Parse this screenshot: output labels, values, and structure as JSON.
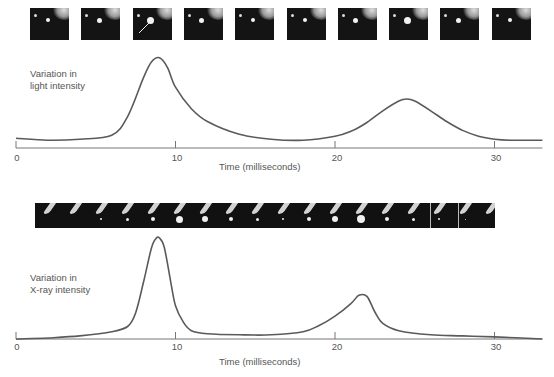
{
  "chart_data": [
    {
      "type": "line",
      "title": "",
      "ylabel": "Variation in light intensity",
      "xlabel": "Time (milliseconds)",
      "x_ticks": [
        0,
        10,
        20,
        30
      ],
      "xlim": [
        0,
        33
      ],
      "grid": false,
      "legend": null,
      "series": [
        {
          "name": "Light intensity",
          "x": [
            0,
            2,
            4,
            6,
            7,
            8,
            8.5,
            9,
            9.5,
            10,
            11,
            12,
            14,
            16,
            18,
            20,
            21,
            22,
            23,
            24,
            24.5,
            25,
            26,
            27,
            28,
            29,
            30,
            31,
            33
          ],
          "y": [
            0.1,
            0.08,
            0.09,
            0.13,
            0.32,
            0.72,
            0.88,
            0.92,
            0.82,
            0.62,
            0.4,
            0.27,
            0.14,
            0.09,
            0.08,
            0.12,
            0.17,
            0.26,
            0.38,
            0.48,
            0.5,
            0.48,
            0.38,
            0.27,
            0.18,
            0.12,
            0.09,
            0.08,
            0.08
          ]
        }
      ],
      "annotations": [
        "image strip: 10 frames above plot, arrow pointing to flash in frame 3"
      ]
    },
    {
      "type": "line",
      "title": "",
      "ylabel": "Variation in X-ray intensity",
      "xlabel": "Time (milliseconds)",
      "x_ticks": [
        0,
        10,
        20,
        30
      ],
      "xlim": [
        0,
        33
      ],
      "grid": false,
      "legend": null,
      "series": [
        {
          "name": "X-ray intensity",
          "x": [
            0,
            2,
            4,
            6,
            7,
            7.5,
            8,
            8.5,
            8.8,
            9,
            9.3,
            9.7,
            10,
            10.5,
            11,
            12,
            14,
            16,
            18,
            19,
            20,
            21,
            21.5,
            22,
            22.5,
            23,
            24,
            26,
            28,
            30,
            33
          ],
          "y": [
            0.0,
            0.01,
            0.03,
            0.07,
            0.12,
            0.25,
            0.55,
            0.88,
            0.97,
            0.97,
            0.88,
            0.55,
            0.32,
            0.16,
            0.08,
            0.05,
            0.04,
            0.04,
            0.07,
            0.13,
            0.22,
            0.34,
            0.42,
            0.41,
            0.26,
            0.15,
            0.08,
            0.04,
            0.03,
            0.02,
            0.0
          ]
        }
      ],
      "annotations": [
        "image strip: continuous band of frames above plot"
      ]
    }
  ],
  "top": {
    "ylabel_line1": "Variation in",
    "ylabel_line2": "light intensity",
    "xlabel": "Time (milliseconds)",
    "ticks": [
      "0",
      "10",
      "20",
      "30"
    ],
    "frame_count": 10
  },
  "bottom": {
    "ylabel_line1": "Variation in",
    "ylabel_line2": "X-ray intensity",
    "xlabel": "Time (milliseconds)",
    "ticks": [
      "0",
      "10",
      "20",
      "30"
    ]
  },
  "colors": {
    "curve": "#5a5a5a",
    "axis": "#777777",
    "frame_bg": "#141414",
    "frame_glow": "#f2f2f2"
  }
}
